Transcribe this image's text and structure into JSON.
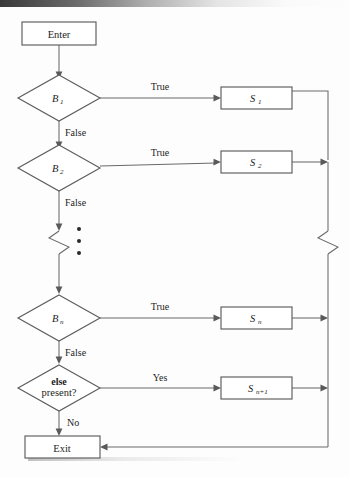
{
  "diagram": {
    "type": "flowchart",
    "nodes": [
      {
        "id": "enter",
        "shape": "rectangle",
        "label": "Enter",
        "x": 59,
        "y": 33
      },
      {
        "id": "b1",
        "shape": "diamond",
        "label": "B",
        "sub": "1",
        "x": 59,
        "y": 98
      },
      {
        "id": "b2",
        "shape": "diamond",
        "label": "B",
        "sub": "2",
        "x": 59,
        "y": 168
      },
      {
        "id": "bn",
        "shape": "diamond",
        "label": "B",
        "sub": "n",
        "x": 59,
        "y": 318
      },
      {
        "id": "else",
        "shape": "diamond",
        "label": "else",
        "label2": "present?",
        "x": 59,
        "y": 388
      },
      {
        "id": "exit",
        "shape": "rectangle",
        "label": "Exit",
        "x": 62,
        "y": 447
      },
      {
        "id": "s1",
        "shape": "rectangle",
        "label": "S",
        "sub": "1",
        "x": 256,
        "y": 98
      },
      {
        "id": "s2",
        "shape": "rectangle",
        "label": "S",
        "sub": "2",
        "x": 256,
        "y": 162
      },
      {
        "id": "sn",
        "shape": "rectangle",
        "label": "S",
        "sub": "n",
        "x": 256,
        "y": 318
      },
      {
        "id": "sn1",
        "shape": "rectangle",
        "label": "S",
        "sub": "n+1",
        "x": 256,
        "y": 388
      }
    ],
    "edge_labels": {
      "true_1": "True",
      "true_2": "True",
      "true_n": "True",
      "yes": "Yes",
      "false_1": "False",
      "false_2": "False",
      "false_n": "False",
      "no": "No"
    },
    "ellipsis": {
      "glyph": "•",
      "count": 3,
      "orientation": "vertical"
    },
    "break_symbols": [
      {
        "on": "left-spine",
        "x": 59,
        "y": 240
      },
      {
        "on": "right-spine",
        "x": 328,
        "y": 240
      }
    ],
    "colors": {
      "stroke": "#5d5d5d",
      "edge": "#6a6a6a",
      "fill": "#ffffff",
      "text": "#1d1d1d",
      "page": "#fdfdfd"
    }
  }
}
